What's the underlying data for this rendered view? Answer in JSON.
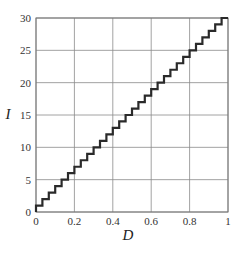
{
  "chart_data": {
    "type": "line",
    "title": "",
    "xlabel": "D",
    "ylabel": "I",
    "xlim": [
      0,
      1
    ],
    "ylim": [
      0,
      30
    ],
    "x_ticks": [
      "0",
      "0.2",
      "0.4",
      "0.6",
      "0.8",
      "1"
    ],
    "y_ticks": [
      "0",
      "5",
      "10",
      "15",
      "20",
      "25",
      "30"
    ],
    "grid": true,
    "legend": null,
    "series": [
      {
        "name": "staircase",
        "style": "step",
        "steps": 30,
        "x": [
          0,
          1
        ],
        "y": [
          0,
          30
        ],
        "description": "Staircase function I = ceil(30*D), 30 uniform steps from (0,0) to (1,30)"
      }
    ]
  },
  "colors": {
    "grid": "#8a8a8a",
    "line": "#2a2a2a",
    "background": "#ffffff"
  }
}
